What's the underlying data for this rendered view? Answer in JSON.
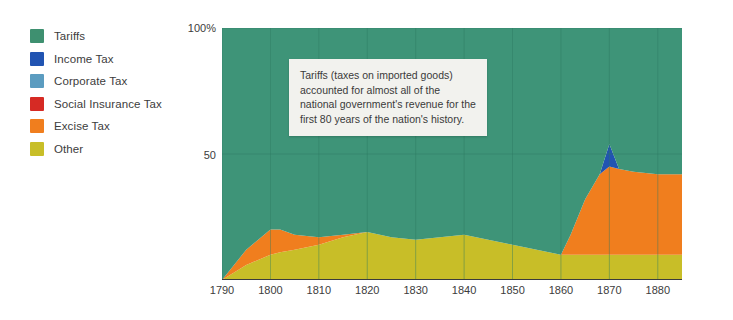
{
  "chart_data": {
    "type": "area",
    "title": "",
    "subtitle": "",
    "xlabel": "",
    "ylabel": "",
    "stacked": true,
    "grid": true,
    "legend_position": "left",
    "xlim": [
      1790,
      1885
    ],
    "ylim": [
      0,
      100
    ],
    "y_ticks": [
      "100%",
      "50"
    ],
    "y_tick_values": [
      100,
      50
    ],
    "x_ticks": [
      "1790",
      "1800",
      "1810",
      "1820",
      "1830",
      "1840",
      "1850",
      "1860",
      "1870",
      "1880"
    ],
    "x_tick_values": [
      1790,
      1800,
      1810,
      1820,
      1830,
      1840,
      1850,
      1860,
      1870,
      1880
    ],
    "x": [
      1790,
      1795,
      1800,
      1802,
      1805,
      1810,
      1815,
      1820,
      1825,
      1830,
      1835,
      1840,
      1845,
      1850,
      1855,
      1860,
      1862,
      1865,
      1868,
      1870,
      1872,
      1875,
      1880,
      1885
    ],
    "series": [
      {
        "name": "Other",
        "color": "#c8be28",
        "values": [
          0,
          6,
          10,
          11,
          12,
          14,
          17,
          19,
          17,
          16,
          17,
          18,
          16,
          14,
          12,
          10,
          10,
          10,
          10,
          10,
          10,
          10,
          10,
          10
        ]
      },
      {
        "name": "Excise Tax",
        "color": "#f07e1e",
        "values": [
          0,
          6,
          10,
          9,
          6,
          3,
          1,
          0,
          0,
          0,
          0,
          0,
          0,
          0,
          0,
          0,
          8,
          22,
          32,
          35,
          34,
          33,
          32,
          32
        ]
      },
      {
        "name": "Social Insurance Tax",
        "color": "#d62a24",
        "values": [
          0,
          0,
          0,
          0,
          0,
          0,
          0,
          0,
          0,
          0,
          0,
          0,
          0,
          0,
          0,
          0,
          0,
          0,
          0,
          0,
          0,
          0,
          0,
          0
        ]
      },
      {
        "name": "Corporate Tax",
        "color": "#5b9cc0",
        "values": [
          0,
          0,
          0,
          0,
          0,
          0,
          0,
          0,
          0,
          0,
          0,
          0,
          0,
          0,
          0,
          0,
          0,
          0,
          0,
          0,
          0,
          0,
          0,
          0
        ]
      },
      {
        "name": "Income Tax",
        "color": "#2154b2",
        "values": [
          0,
          0,
          0,
          0,
          0,
          0,
          0,
          0,
          0,
          0,
          0,
          0,
          0,
          0,
          0,
          0,
          0,
          0,
          0,
          9,
          0,
          0,
          0,
          0
        ]
      },
      {
        "name": "Tariffs",
        "color": "#3e9478",
        "values": [
          100,
          88,
          80,
          80,
          82,
          83,
          82,
          81,
          83,
          84,
          83,
          82,
          84,
          86,
          88,
          90,
          82,
          68,
          58,
          46,
          56,
          57,
          58,
          58
        ]
      }
    ],
    "annotation": {
      "text": "Tariffs (taxes on imported goods) accounted for almost all of the national government's revenue for the first 80 years of the nation's history."
    }
  },
  "legend": {
    "items": [
      {
        "label": "Tariffs",
        "color": "#3e9070",
        "name": "tariffs"
      },
      {
        "label": "Income Tax",
        "color": "#2154b2",
        "name": "income-tax"
      },
      {
        "label": "Corporate Tax",
        "color": "#5b9cc0",
        "name": "corporate-tax"
      },
      {
        "label": "Social Insurance Tax",
        "color": "#d62a24",
        "name": "social-insurance-tax"
      },
      {
        "label": "Excise Tax",
        "color": "#f07e1e",
        "name": "excise-tax"
      },
      {
        "label": "Other",
        "color": "#c8be28",
        "name": "other"
      }
    ]
  },
  "axes": {
    "y_top_label": "100%",
    "y_mid_label": "50"
  },
  "colors": {
    "background": "#ffffff",
    "grid": "#2f7a62",
    "axis_line": "#3c3c3c",
    "text": "#3c3c3c",
    "annotation_bg": "#f2f2ee"
  }
}
